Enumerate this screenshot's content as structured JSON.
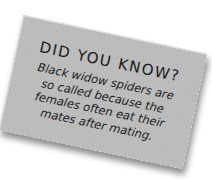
{
  "card": {
    "title": "DID YOU KNOW?",
    "lines": [
      "Black widow spiders are",
      "so called because the",
      "females often eat their",
      "mates after mating."
    ]
  },
  "colors": {
    "card": "#bcbcbc",
    "text": "#1a1a1a",
    "background": "#ffffff"
  }
}
